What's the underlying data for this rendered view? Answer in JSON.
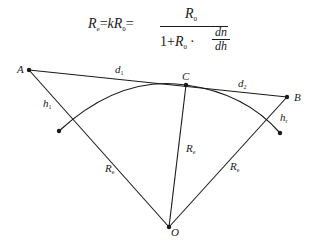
{
  "formula": {
    "lhs": "R",
    "lhs_sub": "e",
    "eq1": "=",
    "k": "k",
    "r0": "R",
    "r0_sub": "0",
    "eq2": "=",
    "numerator": "R",
    "numerator_sub": "0",
    "denominator_prefix": "1+",
    "denominator_r": "R",
    "denominator_r_sub": "0",
    "dot": "·",
    "dn": "dn",
    "dh": "dh",
    "full_text": "R_e = kR_0 = R_0 / (1 + R_0 · dn/dh)"
  },
  "diagram": {
    "points": {
      "A": {
        "label": "A",
        "x": 29,
        "y": 70
      },
      "B": {
        "label": "B",
        "x": 287,
        "y": 97
      },
      "C": {
        "label": "C",
        "x": 186,
        "y": 85
      },
      "O": {
        "label": "O",
        "x": 169,
        "y": 227
      }
    },
    "arc_endpoints": {
      "left": {
        "x": 59,
        "y": 131
      },
      "right": {
        "x": 280,
        "y": 133
      }
    },
    "labels": {
      "d1": {
        "text": "d",
        "sub": "1"
      },
      "d2": {
        "text": "d",
        "sub": "2"
      },
      "h1": {
        "text": "h",
        "sub": "1"
      },
      "h2": {
        "text": "h",
        "sub": "r"
      },
      "Re_center": {
        "text": "R",
        "sub": "e"
      },
      "Re_left": {
        "text": "R",
        "sub": "e"
      },
      "Re_right": {
        "text": "R",
        "sub": "e"
      }
    },
    "colors": {
      "stroke": "#1a1a1a",
      "background": "#ffffff"
    }
  }
}
